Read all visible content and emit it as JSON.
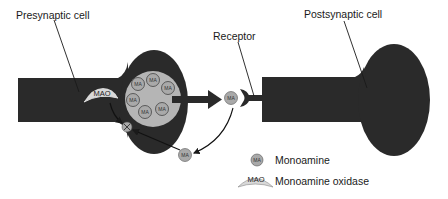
{
  "labels": {
    "presynaptic": "Presynaptic cell",
    "postsynaptic": "Postsynaptic cell",
    "receptor": "Receptor"
  },
  "legend": {
    "items": [
      {
        "symbol": "MA",
        "label": "Monoamine"
      },
      {
        "symbol": "MAO",
        "label": "Monoamine oxidase"
      }
    ]
  },
  "molecules": {
    "ma_label": "MA",
    "mao_label": "MAO",
    "vesicle_count": 7
  },
  "colors": {
    "cell_fill": "#2a2a2a",
    "vesicle_fill": "#b5b5b5",
    "molecule_fill": "#a9a9a9",
    "enzyme_fill": "#d8d8d8",
    "line": "#1a1a1a"
  }
}
